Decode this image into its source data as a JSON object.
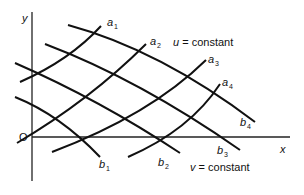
{
  "diagram": {
    "axes": {
      "origin_label": "O",
      "x_label": "x",
      "y_label": "y"
    },
    "u_curves": {
      "legend": "u = constant",
      "legend_var": "u",
      "legend_rest": " = constant",
      "labels": [
        {
          "base": "a",
          "sub": "1"
        },
        {
          "base": "a",
          "sub": "2"
        },
        {
          "base": "a",
          "sub": "3"
        },
        {
          "base": "a",
          "sub": "4"
        }
      ]
    },
    "v_curves": {
      "legend": "v = constant",
      "legend_var": "v",
      "legend_rest": " = constant",
      "labels": [
        {
          "base": "b",
          "sub": "1"
        },
        {
          "base": "b",
          "sub": "2"
        },
        {
          "base": "b",
          "sub": "3"
        },
        {
          "base": "b",
          "sub": "4"
        }
      ]
    },
    "colors": {
      "line": "#111111",
      "axis": "#222222",
      "background": "#ffffff"
    }
  }
}
